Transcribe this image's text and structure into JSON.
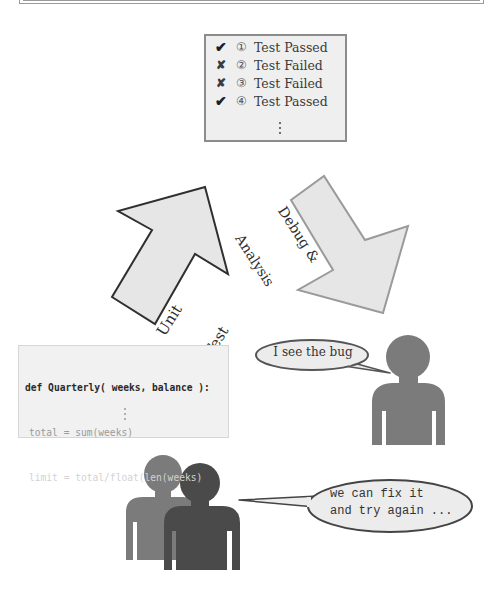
{
  "test_results": {
    "items": [
      {
        "mark": "✔",
        "status": "pass",
        "number": "①",
        "label": "Test Passed"
      },
      {
        "mark": "✘",
        "status": "fail",
        "number": "②",
        "label": "Test Failed"
      },
      {
        "mark": "✘",
        "status": "fail",
        "number": "③",
        "label": "Test Failed"
      },
      {
        "mark": "✔",
        "status": "pass",
        "number": "④",
        "label": "Test Passed"
      }
    ],
    "more_indicator": "⋮"
  },
  "arrows": {
    "unit_test": {
      "line1": "Unit",
      "line2": "Test"
    },
    "debug": {
      "line1": "Debug &",
      "line2": "Analysis"
    }
  },
  "code": {
    "line1": "def Quarterly( weeks, balance ):",
    "line2": "total = sum(weeks)",
    "line3": "limit = total/float(len(weeks)",
    "more_indicator": "⋮"
  },
  "bubbles": {
    "developer": "I see the bug",
    "team_line1": "we can fix it",
    "team_line2": "and try again ..."
  },
  "colors": {
    "arrow_fill": "#e6e6e6",
    "arrow_stroke_dark": "#2f2f2f",
    "arrow_stroke_light": "#9a9a9a",
    "person_mid": "#7b7b7b",
    "person_dark": "#4a4a4a",
    "bubble_fill": "#ececec",
    "bubble_stroke": "#555555"
  }
}
